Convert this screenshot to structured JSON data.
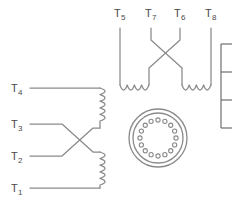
{
  "diagram": {
    "colors": {
      "wire": "#8a8a8a",
      "label": "#4a4a4a",
      "panel": "#6e6e6e",
      "background": "#ffffff"
    },
    "top_group": {
      "name": "upper-winding-group",
      "leads": [
        {
          "id": "T5",
          "base": "T",
          "sub": "5",
          "x": 120,
          "label_x": 117,
          "label_y": 17
        },
        {
          "id": "T7",
          "base": "T",
          "sub": "7",
          "x": 151,
          "label_x": 148,
          "label_y": 17
        },
        {
          "id": "T6",
          "base": "T",
          "sub": "6",
          "x": 180,
          "label_x": 177,
          "label_y": 17
        },
        {
          "id": "T8",
          "base": "T",
          "sub": "8",
          "x": 211,
          "label_x": 208,
          "label_y": 17
        }
      ],
      "crossing": true,
      "coil_count": 2
    },
    "left_group": {
      "name": "left-winding-group",
      "leads": [
        {
          "id": "T4",
          "base": "T",
          "sub": "4",
          "y": 88,
          "label_x": 12,
          "label_y": 92
        },
        {
          "id": "T3",
          "base": "T",
          "sub": "3",
          "y": 124,
          "label_x": 12,
          "label_y": 128
        },
        {
          "id": "T2",
          "base": "T",
          "sub": "2",
          "y": 156,
          "label_x": 12,
          "label_y": 160
        },
        {
          "id": "T1",
          "base": "T",
          "sub": "1",
          "y": 188,
          "label_x": 12,
          "label_y": 192
        }
      ],
      "crossing": true,
      "coil_count": 2
    },
    "connector": {
      "name": "circular-connector",
      "center_x": 158,
      "center_y": 138,
      "outer_radius": 29,
      "inner_radius": 25,
      "pin_ring_radius": 18,
      "pin_radius": 2.1,
      "pin_count": 16
    },
    "side_panel": {
      "name": "legend-table-partial",
      "visible": "partially cut off at right edge",
      "rows": 3
    }
  }
}
